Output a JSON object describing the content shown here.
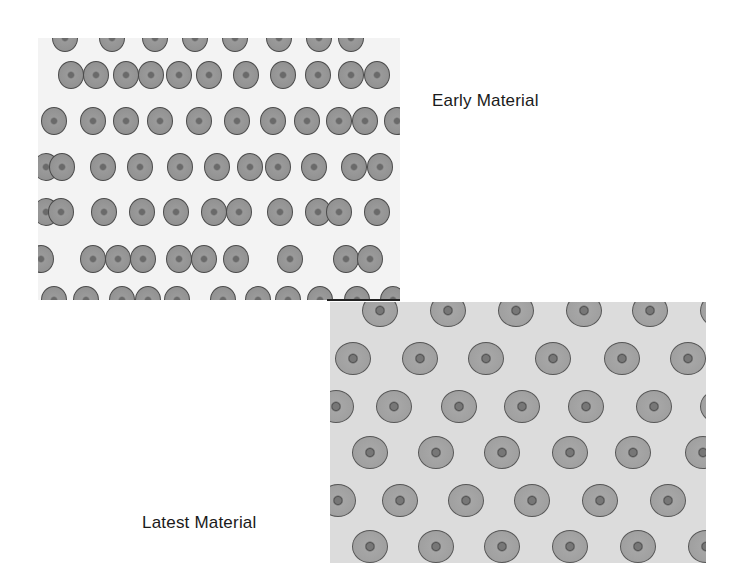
{
  "slide": {
    "labels": {
      "early": "Early Material",
      "latest": "Latest Material"
    },
    "colors": {
      "background": "#ffffff",
      "early_field": "#f3f3f3",
      "latest_field": "#dcdcdc",
      "disc_fill": "#9a9a9a",
      "disc_edge": "#4a4a4a",
      "text": "#1a1a1a"
    }
  },
  "early_discs": [
    [
      14,
      -14
    ],
    [
      61,
      -14
    ],
    [
      104,
      -14
    ],
    [
      144,
      -14
    ],
    [
      184,
      -14
    ],
    [
      228,
      -14
    ],
    [
      268,
      -14
    ],
    [
      300,
      -14
    ],
    [
      20,
      23
    ],
    [
      45,
      23
    ],
    [
      75,
      23
    ],
    [
      100,
      23
    ],
    [
      128,
      23
    ],
    [
      158,
      23
    ],
    [
      195,
      23
    ],
    [
      232,
      23
    ],
    [
      267,
      23
    ],
    [
      300,
      23
    ],
    [
      326,
      23
    ],
    [
      3,
      69
    ],
    [
      42,
      69
    ],
    [
      75,
      69
    ],
    [
      109,
      69
    ],
    [
      148,
      69
    ],
    [
      186,
      69
    ],
    [
      222,
      69
    ],
    [
      256,
      69
    ],
    [
      288,
      69
    ],
    [
      314,
      69
    ],
    [
      346,
      69
    ],
    [
      -5,
      115
    ],
    [
      11,
      115
    ],
    [
      52,
      115
    ],
    [
      89,
      115
    ],
    [
      129,
      115
    ],
    [
      166,
      115
    ],
    [
      199,
      115
    ],
    [
      227,
      115
    ],
    [
      263,
      115
    ],
    [
      303,
      115
    ],
    [
      329,
      115
    ],
    [
      -5,
      160
    ],
    [
      10,
      160
    ],
    [
      53,
      160
    ],
    [
      91,
      160
    ],
    [
      125,
      160
    ],
    [
      163,
      160
    ],
    [
      188,
      160
    ],
    [
      229,
      160
    ],
    [
      267,
      160
    ],
    [
      288,
      160
    ],
    [
      326,
      160
    ],
    [
      -10,
      207
    ],
    [
      42,
      207
    ],
    [
      67,
      207
    ],
    [
      92,
      207
    ],
    [
      128,
      207
    ],
    [
      153,
      207
    ],
    [
      185,
      207
    ],
    [
      239,
      207
    ],
    [
      295,
      207
    ],
    [
      319,
      207
    ],
    [
      3,
      248
    ],
    [
      35,
      248
    ],
    [
      71,
      248
    ],
    [
      97,
      248
    ],
    [
      126,
      248
    ],
    [
      172,
      248
    ],
    [
      207,
      248
    ],
    [
      237,
      248
    ],
    [
      269,
      248
    ],
    [
      306,
      248
    ],
    [
      342,
      248
    ]
  ],
  "latest_discs": [
    [
      32,
      -8
    ],
    [
      100,
      -8
    ],
    [
      168,
      -8
    ],
    [
      236,
      -8
    ],
    [
      302,
      -8
    ],
    [
      370,
      -8
    ],
    [
      5,
      40
    ],
    [
      72,
      40
    ],
    [
      138,
      40
    ],
    [
      205,
      40
    ],
    [
      274,
      40
    ],
    [
      340,
      40
    ],
    [
      -12,
      88
    ],
    [
      46,
      88
    ],
    [
      111,
      88
    ],
    [
      174,
      88
    ],
    [
      238,
      88
    ],
    [
      306,
      88
    ],
    [
      370,
      88
    ],
    [
      22,
      134
    ],
    [
      88,
      134
    ],
    [
      154,
      134
    ],
    [
      222,
      134
    ],
    [
      285,
      134
    ],
    [
      355,
      134
    ],
    [
      -10,
      182
    ],
    [
      52,
      182
    ],
    [
      118,
      182
    ],
    [
      184,
      182
    ],
    [
      252,
      182
    ],
    [
      320,
      182
    ],
    [
      22,
      228
    ],
    [
      88,
      228
    ],
    [
      154,
      228
    ],
    [
      222,
      228
    ],
    [
      290,
      228
    ],
    [
      358,
      228
    ]
  ]
}
